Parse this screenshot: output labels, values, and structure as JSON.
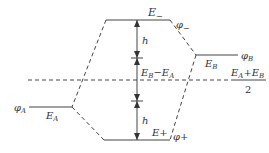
{
  "diagram": {
    "type": "molecular-orbital-energy-level",
    "levels": {
      "antibonding": {
        "energy_label": "E",
        "energy_sub": "−",
        "orbital_label": "φ",
        "orbital_sub": "−"
      },
      "bonding": {
        "energy_label": "E+",
        "orbital_label": "φ+"
      },
      "atomic_a": {
        "energy_label": "E",
        "energy_sub": "A",
        "orbital_label": "φ",
        "orbital_sub": "A"
      },
      "atomic_b": {
        "energy_label": "E",
        "energy_sub": "B",
        "orbital_label": "φ",
        "orbital_sub": "B"
      }
    },
    "gap_upper": {
      "label": "h"
    },
    "gap_lower": {
      "label": "h"
    },
    "difference": {
      "label_left": "E",
      "sub_left": "B",
      "dash": "−",
      "label_right": "E",
      "sub_right": "A"
    },
    "midline": {
      "numerator_e1": "E",
      "numerator_sub1": "A",
      "plus": "+",
      "numerator_e2": "E",
      "numerator_sub2": "B",
      "denominator": "2"
    },
    "colors": {
      "line": "#444444",
      "text": "#333333",
      "background": "#ffffff"
    }
  }
}
